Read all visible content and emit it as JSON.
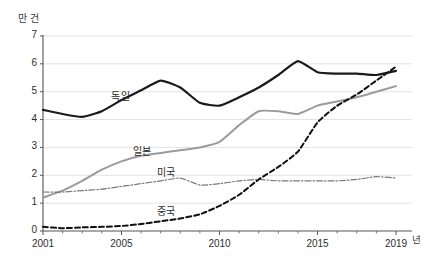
{
  "chart_data": {
    "type": "line",
    "title": "",
    "subtitle": "",
    "xlabel": "년",
    "ylabel": "만 건",
    "unit_label": "만 건",
    "x_unit_label": "년",
    "x": [
      2001,
      2002,
      2003,
      2004,
      2005,
      2006,
      2007,
      2008,
      2009,
      2010,
      2011,
      2012,
      2013,
      2014,
      2015,
      2016,
      2017,
      2018,
      2019
    ],
    "xlim": [
      2001,
      2019
    ],
    "ylim": [
      0,
      7
    ],
    "x_ticks": [
      2001,
      2005,
      2010,
      2015,
      2019
    ],
    "x_tick_labels": [
      "2001",
      "2005",
      "2010",
      "2015",
      "2019"
    ],
    "x_minor_ticks": [
      2002,
      2003,
      2004,
      2006,
      2007,
      2008,
      2009,
      2011,
      2012,
      2013,
      2014,
      2016,
      2017,
      2018
    ],
    "y_ticks": [
      0,
      1,
      2,
      3,
      4,
      5,
      6,
      7
    ],
    "y_tick_labels": [
      "0",
      "1",
      "2",
      "3",
      "4",
      "5",
      "6",
      "7"
    ],
    "grid": "horizontal",
    "legend_position": "inline-labels",
    "series": [
      {
        "name": "독일",
        "style": "solid",
        "color": "#1a1a1a",
        "width": 2.2,
        "label_x": 2005.0,
        "label_y": 4.92,
        "values": [
          4.35,
          4.2,
          4.1,
          4.3,
          4.7,
          5.05,
          5.4,
          5.15,
          4.6,
          4.5,
          4.8,
          5.15,
          5.6,
          6.1,
          5.7,
          5.65,
          5.65,
          5.6,
          5.75
        ]
      },
      {
        "name": "일본",
        "style": "solid",
        "color": "#9b9b9b",
        "width": 2.0,
        "label_x": 2006.1,
        "label_y": 2.95,
        "values": [
          1.2,
          1.45,
          1.8,
          2.2,
          2.5,
          2.7,
          2.8,
          2.9,
          3.0,
          3.2,
          3.8,
          4.3,
          4.3,
          4.2,
          4.5,
          4.65,
          4.8,
          5.0,
          5.2
        ]
      },
      {
        "name": "미국",
        "style": "dashdot",
        "color": "#7a7a7a",
        "width": 1.2,
        "label_x": 2007.3,
        "label_y": 2.18,
        "values": [
          1.4,
          1.4,
          1.45,
          1.5,
          1.6,
          1.7,
          1.8,
          1.9,
          1.65,
          1.7,
          1.8,
          1.85,
          1.8,
          1.8,
          1.8,
          1.8,
          1.85,
          1.95,
          1.9
        ]
      },
      {
        "name": "중국",
        "style": "dashed",
        "color": "#111111",
        "width": 2.0,
        "label_x": 2007.3,
        "label_y": 0.78,
        "values": [
          0.15,
          0.1,
          0.13,
          0.15,
          0.18,
          0.25,
          0.35,
          0.45,
          0.6,
          0.9,
          1.3,
          1.85,
          2.3,
          2.85,
          3.9,
          4.5,
          4.9,
          5.4,
          5.9
        ]
      }
    ],
    "colors": {
      "axis": "#555555",
      "grid": "#e3e3e3",
      "text": "#2e2e2e",
      "background": "#ffffff"
    }
  }
}
